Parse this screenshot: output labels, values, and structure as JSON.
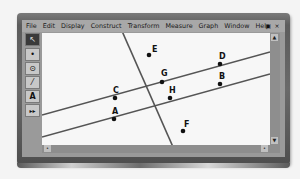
{
  "menu": {
    "items": [
      "File",
      "Edit",
      "Display",
      "Construct",
      "Transform",
      "Measure",
      "Graph",
      "Window",
      "Help"
    ],
    "restore_icon": "▣",
    "close_icon": "×"
  },
  "toolbox": {
    "tools": [
      {
        "name": "arrow-tool",
        "glyph": "↖"
      },
      {
        "name": "point-tool",
        "glyph": "•"
      },
      {
        "name": "compass-tool",
        "glyph": "⊙"
      },
      {
        "name": "straightedge-tool",
        "glyph": "⁄"
      },
      {
        "name": "text-tool",
        "glyph": "A"
      },
      {
        "name": "custom-tool",
        "glyph": "▸▸"
      }
    ]
  },
  "scroll": {
    "up": "▲",
    "down": "▼",
    "left": "•",
    "right": "•"
  },
  "geometry": {
    "points": [
      {
        "label": "E",
        "x": 107,
        "y": 22
      },
      {
        "label": "D",
        "x": 178,
        "y": 31
      },
      {
        "label": "G",
        "x": 120,
        "y": 49
      },
      {
        "label": "B",
        "x": 178,
        "y": 51
      },
      {
        "label": "C",
        "x": 73,
        "y": 65
      },
      {
        "label": "H",
        "x": 128,
        "y": 65
      },
      {
        "label": "A",
        "x": 72,
        "y": 86
      },
      {
        "label": "F",
        "x": 141,
        "y": 98
      }
    ],
    "line_color": "#555555",
    "point_color": "#111111"
  }
}
